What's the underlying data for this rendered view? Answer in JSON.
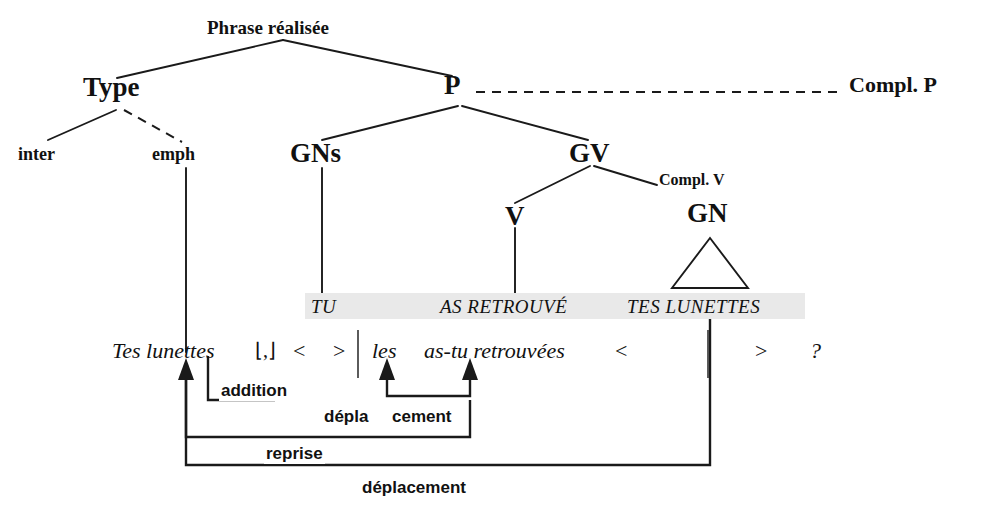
{
  "diagram": {
    "title": "Phrase réalisée",
    "language": "fr",
    "type": "syntax-tree-transformation"
  },
  "tree": {
    "root": "Phrase réalisée",
    "nodes": [
      {
        "id": "root",
        "label": "Phrase réalisée"
      },
      {
        "id": "type",
        "label": "Type"
      },
      {
        "id": "p",
        "label": "P"
      },
      {
        "id": "complp",
        "label": "Compl. P"
      },
      {
        "id": "inter",
        "label": "inter"
      },
      {
        "id": "emph",
        "label": "emph"
      },
      {
        "id": "gns",
        "label": "GNs"
      },
      {
        "id": "gv",
        "label": "GV"
      },
      {
        "id": "complv",
        "label": "Compl. V"
      },
      {
        "id": "v",
        "label": "V"
      },
      {
        "id": "gn",
        "label": "GN"
      }
    ]
  },
  "deep_structure": {
    "band_label": "TU AS RETROUVÉ TES LUNETTES",
    "segments": [
      {
        "text": "TU"
      },
      {
        "text": "AS RETROUVÉ"
      },
      {
        "text": "TES LUNETTES"
      }
    ],
    "band_color": "#e9e9e9"
  },
  "surface_structure": {
    "tokens": [
      {
        "text": "Tes lunettes",
        "style": "italic"
      },
      {
        "text": "⌊,⌋",
        "style": "symbol"
      },
      {
        "text": "<",
        "style": "symbol"
      },
      {
        "text": ">",
        "style": "symbol"
      },
      {
        "text": "les",
        "style": "italic"
      },
      {
        "text": "as-tu retrouvées",
        "style": "italic"
      },
      {
        "text": "<",
        "style": "symbol"
      },
      {
        "text": ">",
        "style": "symbol"
      },
      {
        "text": "?",
        "style": "italic"
      }
    ]
  },
  "operations": [
    {
      "id": "addition",
      "label": "addition"
    },
    {
      "id": "deplacement1",
      "label": "dépla"
    },
    {
      "id": "deplacement2",
      "label": "cement"
    },
    {
      "id": "reprise",
      "label": "reprise"
    },
    {
      "id": "deplacement3",
      "label": "déplacement"
    }
  ]
}
